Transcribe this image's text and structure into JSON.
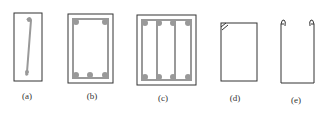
{
  "figure": {
    "panels": [
      {
        "id": "a",
        "label": "(a)",
        "desc": "single-leg tie with hooks"
      },
      {
        "id": "b",
        "label": "(b)",
        "desc": "closed rectangular stirrup with bars"
      },
      {
        "id": "c",
        "label": "(c)",
        "desc": "multi-leg stirrup with bars"
      },
      {
        "id": "d",
        "label": "(d)",
        "desc": "closed stirrup with hooked end"
      },
      {
        "id": "e",
        "label": "(e)",
        "desc": "open U stirrup with hooks"
      }
    ],
    "colors": {
      "line": "#333333",
      "bar": "#999999"
    }
  }
}
